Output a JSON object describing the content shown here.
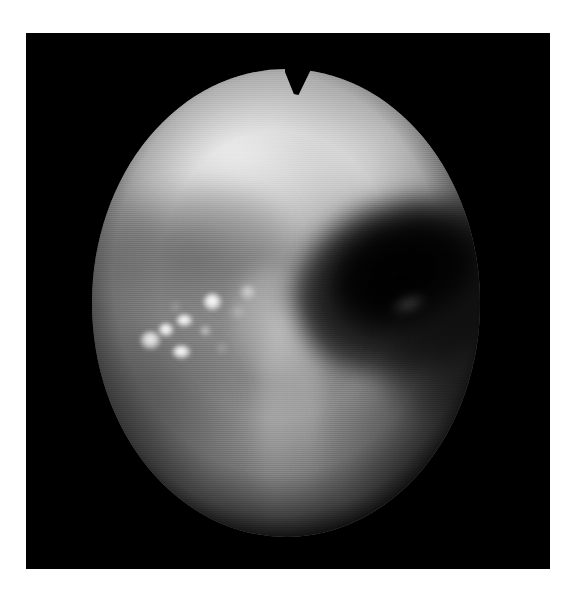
{
  "page": {
    "background_color": "#ffffff",
    "width": 577,
    "height": 598
  },
  "photo": {
    "kind": "endoscopic-photograph",
    "modality": "white-light endoscopy",
    "color_mode": "grayscale",
    "frame": {
      "left": 26,
      "top": 33,
      "width": 524,
      "height": 536,
      "background_color": "#000000"
    },
    "field_of_view": {
      "shape": "oval",
      "left": 92,
      "top": 69,
      "width": 388,
      "height": 468,
      "notch": {
        "position": "top-center",
        "left": 285,
        "top": 69,
        "width": 26,
        "height": 28
      }
    },
    "regions": [
      {
        "name": "bright-mucosa-dome-upper-left",
        "tone": "bright",
        "approx_gray": "#e0e0e0",
        "center_x": 181,
        "center_y": 132
      },
      {
        "name": "bright-mucosa-dome-upper-right",
        "tone": "bright",
        "approx_gray": "#d8d8d8",
        "center_x": 366,
        "center_y": 120
      },
      {
        "name": "dark-lumen-opening",
        "tone": "very dark",
        "approx_gray": "#0a0a0a",
        "center_x": 381,
        "center_y": 270
      },
      {
        "name": "mid-grey-mucosal-wall",
        "tone": "mid grey",
        "approx_gray": "#8c8c8c",
        "center_x": 250,
        "center_y": 420
      },
      {
        "name": "vertical-mucosal-fold",
        "tone": "pale grey",
        "approx_gray": "#b4b4b4",
        "center_x": 291,
        "center_y": 420
      },
      {
        "name": "shadowed-rim-lower-left",
        "tone": "dark grey",
        "approx_gray": "#4a4a4a",
        "center_x": 130,
        "center_y": 420
      },
      {
        "name": "shadowed-rim-lower-right",
        "tone": "dark grey",
        "approx_gray": "#4a4a4a",
        "center_x": 420,
        "center_y": 430
      }
    ],
    "specular_highlights": [
      {
        "id": "spot-1",
        "x": 212,
        "y": 302,
        "w": 19,
        "h": 18,
        "intensity": "bright"
      },
      {
        "id": "spot-2",
        "x": 184,
        "y": 320,
        "w": 17,
        "h": 13,
        "intensity": "bright"
      },
      {
        "id": "spot-3",
        "x": 166,
        "y": 330,
        "w": 16,
        "h": 14,
        "intensity": "bright"
      },
      {
        "id": "spot-4",
        "x": 150,
        "y": 340,
        "w": 21,
        "h": 19,
        "intensity": "bright"
      },
      {
        "id": "spot-5",
        "x": 181,
        "y": 352,
        "w": 19,
        "h": 14,
        "intensity": "bright"
      },
      {
        "id": "spot-6",
        "x": 205,
        "y": 331,
        "w": 11,
        "h": 10,
        "intensity": "dim"
      },
      {
        "id": "spot-7",
        "x": 222,
        "y": 348,
        "w": 10,
        "h": 9,
        "intensity": "faint"
      },
      {
        "id": "spot-8",
        "x": 238,
        "y": 312,
        "w": 14,
        "h": 12,
        "intensity": "faint"
      },
      {
        "id": "spot-9",
        "x": 248,
        "y": 292,
        "w": 16,
        "h": 15,
        "intensity": "dim"
      },
      {
        "id": "spot-10",
        "x": 175,
        "y": 307,
        "w": 9,
        "h": 8,
        "intensity": "faint"
      }
    ],
    "caption": "Grayscale endoscopic view: oval field of view with a bright mucosal dome, a dark lumen opening to the right of centre, and a cluster of specular light reflections on the left mucosal wall."
  }
}
